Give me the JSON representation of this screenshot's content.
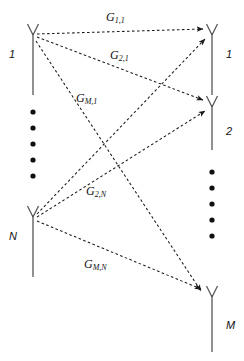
{
  "figure": {
    "type": "mimo-channel-diagram",
    "background_color": "#ffffff",
    "line_color": "#1a1a1a",
    "text_color": "#111111"
  },
  "transmit_array": {
    "antennas": [
      {
        "label": "1",
        "x": 33,
        "y": 33
      },
      {
        "label": "N",
        "x": 33,
        "y": 215
      }
    ],
    "ellipsis_dots": 5
  },
  "receive_array": {
    "antennas": [
      {
        "label": "1",
        "x": 212,
        "y": 33
      },
      {
        "label": "2",
        "x": 212,
        "y": 105
      },
      {
        "label": "M",
        "x": 212,
        "y": 295
      }
    ],
    "ellipsis_dots": 5
  },
  "channels": [
    {
      "name": "G11",
      "label_main": "G",
      "label_sub": "1,1",
      "from": "tx1",
      "to": "rx1"
    },
    {
      "name": "G21",
      "label_main": "G",
      "label_sub": "2,1",
      "from": "tx1",
      "to": "rx2"
    },
    {
      "name": "GM1",
      "label_main": "G",
      "label_sub": "M,1",
      "from": "tx1",
      "to": "rxM"
    },
    {
      "name": "G2N",
      "label_main": "G",
      "label_sub": "2,N",
      "from": "txN",
      "to": "rx2"
    },
    {
      "name": "G1N",
      "label_main": "G",
      "label_sub": "",
      "from": "txN",
      "to": "rx1"
    },
    {
      "name": "GMN",
      "label_main": "G",
      "label_sub": "M,N",
      "from": "txN",
      "to": "rxM"
    }
  ],
  "gain_labels": [
    {
      "id": "g11",
      "main": "G",
      "sub": "1,1",
      "x": 106,
      "y": 11
    },
    {
      "id": "g21",
      "main": "G",
      "sub": "2,1",
      "x": 110,
      "y": 49
    },
    {
      "id": "gm1",
      "main": "G",
      "sub": "M,1",
      "x": 76,
      "y": 92
    },
    {
      "id": "g2n",
      "main": "G",
      "sub": "2,N",
      "x": 86,
      "y": 185
    },
    {
      "id": "gmn",
      "main": "G",
      "sub": "M,N",
      "x": 84,
      "y": 258
    }
  ]
}
